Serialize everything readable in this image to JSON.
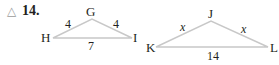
{
  "problem": {
    "icon": "△",
    "number": "14."
  },
  "triangle1": {
    "vertices": {
      "top": "G",
      "left": "H",
      "right": "I"
    },
    "sides": {
      "left": "4",
      "right": "4",
      "base": "7"
    }
  },
  "triangle2": {
    "vertices": {
      "top": "J",
      "left": "K",
      "right": "L"
    },
    "sides": {
      "left": "x",
      "right": "x",
      "base": "14"
    }
  },
  "colors": {
    "line": "#c8c8c8",
    "text": "#231f20",
    "icon": "#9a9a9a"
  }
}
